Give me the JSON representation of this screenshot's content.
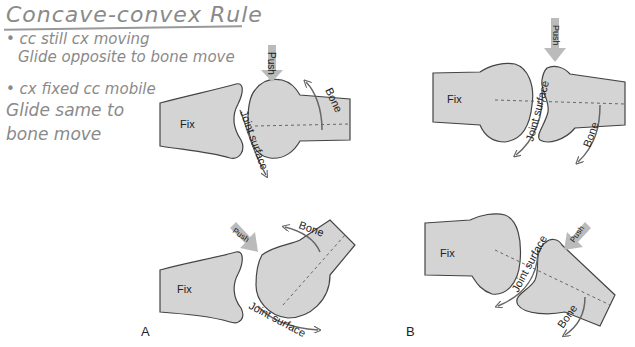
{
  "notes": {
    "title": "Concave-convex Rule",
    "lines": [
      "• cc still cx moving",
      "Glide opposite to bone move",
      "• cx fixed cc mobile",
      "Glide same to",
      "bone move"
    ]
  },
  "diagram": {
    "panels": [
      {
        "label": "A",
        "top": {
          "fixed_label": "Fix",
          "push_label": "Push",
          "bone_label": "Bone",
          "joint_label": "Joint surface"
        },
        "bottom": {
          "fixed_label": "Fix",
          "push_label": "Push",
          "bone_label": "Bone",
          "joint_label": "Joint surface"
        }
      },
      {
        "label": "B",
        "top": {
          "fixed_label": "Fix",
          "push_label": "Push",
          "bone_label": "Bone",
          "joint_label": "Joint surface"
        },
        "bottom": {
          "fixed_label": "Fix",
          "push_label": "Push",
          "bone_label": "Bone",
          "joint_label": "Joint surface"
        }
      }
    ],
    "colors": {
      "bone_fill": "#d4d4d4",
      "outline": "#444444",
      "arrow": "#b8b8b8",
      "note_ink": "#8a8a8a"
    }
  }
}
